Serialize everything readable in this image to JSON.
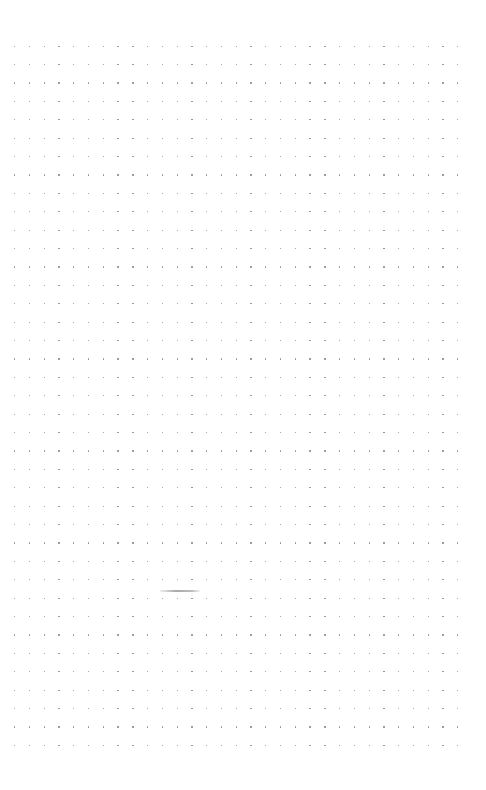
{
  "page": {
    "type": "dot-grid-paper",
    "background_color": "#ffffff",
    "dot_color": "#8c8c8c",
    "grid": {
      "columns": 31,
      "rows": 39,
      "origin_x": 14,
      "origin_y": 45.5,
      "spacing_x": 14.77,
      "spacing_y": 18.4
    },
    "marks": [
      {
        "kind": "pencil-stroke",
        "x": 160,
        "y": 590,
        "width": 40,
        "color": "#a9a9a9"
      }
    ]
  }
}
